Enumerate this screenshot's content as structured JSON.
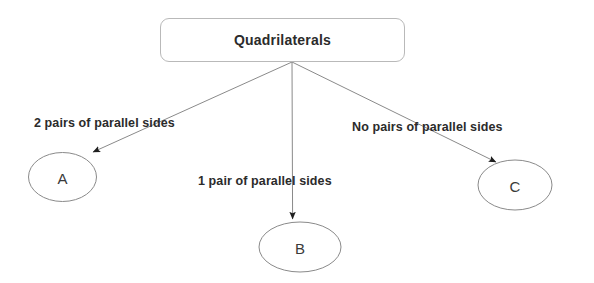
{
  "diagram": {
    "title": "Quadrilaterals",
    "root": {
      "id": "root",
      "label": "Quadrilaterals",
      "shape": "rounded-rectangle"
    },
    "nodes": [
      {
        "id": "a",
        "label": "A",
        "shape": "ellipse"
      },
      {
        "id": "b",
        "label": "B",
        "shape": "ellipse"
      },
      {
        "id": "c",
        "label": "C",
        "shape": "ellipse"
      }
    ],
    "edges": [
      {
        "from": "root",
        "to": "a",
        "label": "2 pairs of parallel sides"
      },
      {
        "from": "root",
        "to": "b",
        "label": "1 pair of parallel sides"
      },
      {
        "from": "root",
        "to": "c",
        "label": "No pairs of parallel sides"
      }
    ],
    "colors": {
      "background": "#ffffff",
      "stroke": "#8a8a8a",
      "box_border": "#b9b9b9",
      "text": "#2b2b2b",
      "arrowhead": "#1f1f1f"
    }
  }
}
